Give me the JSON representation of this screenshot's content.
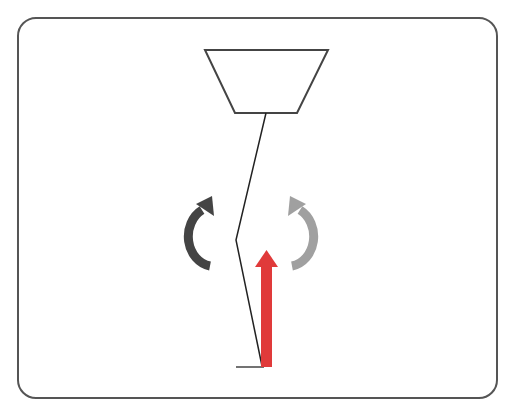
{
  "diagram": {
    "colors": {
      "frame": "#555555",
      "outline": "#444444",
      "line": "#222222",
      "arrow_dark": "#444444",
      "arrow_light": "#a0a0a0",
      "force_arrow": "#e03a3a",
      "background": "#ffffff"
    },
    "elements": {
      "frame": "rounded-rectangle-frame",
      "trapezoid": "trapezoid-body",
      "string": "bent-line",
      "rotate_left": "counterclockwise-arrow-dark",
      "rotate_right": "clockwise-arrow-light",
      "force": "upward-force-arrow"
    }
  }
}
